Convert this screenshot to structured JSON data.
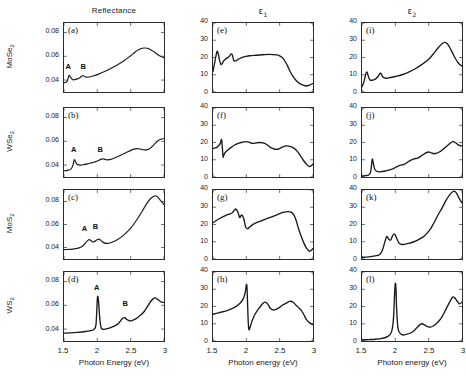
{
  "figure": {
    "columns": [
      {
        "id": "reflectance",
        "label": "Reflectance",
        "type": "plain"
      },
      {
        "id": "eps1",
        "label": "ε",
        "sub": "1",
        "type": "greek"
      },
      {
        "id": "eps2",
        "label": "ε",
        "sub": "2",
        "type": "greek"
      }
    ],
    "rows": [
      {
        "id": "mose2",
        "label": "MoSe",
        "sub": "2"
      },
      {
        "id": "wse2",
        "label": "WSe",
        "sub": "2"
      },
      {
        "id": "mos2",
        "label": "MoS",
        "sub": "2"
      },
      {
        "id": "ws2",
        "label": "WS",
        "sub": "2"
      }
    ],
    "xaxis_labels": {
      "reflectance": "Photon Energy (eV)",
      "eps1": "Photon energy (eV)",
      "eps2": "Photon energy (eV)"
    },
    "xticks": [
      "1.5",
      "2",
      "2.5",
      "3"
    ],
    "yticks_reflectance": [
      "0.04",
      "0.06",
      "0.08"
    ],
    "yticks_eps": [
      "0",
      "10",
      "20",
      "30",
      "40"
    ],
    "peak_labels": {
      "a": "A",
      "b": "B"
    }
  },
  "chart_data": [
    {
      "type": "line",
      "panel": "(a)",
      "row": "MoSe2",
      "column": "Reflectance",
      "title": "Reflectance",
      "xlabel": "Photon Energy (eV)",
      "ylabel": "MoSe2",
      "xlim": [
        1.5,
        3.0
      ],
      "ylim": [
        0.03,
        0.088
      ],
      "grid": false,
      "legend": "none",
      "annotations": [
        {
          "text": "A",
          "x": 1.58,
          "y": 0.0475
        },
        {
          "text": "B",
          "x": 1.8,
          "y": 0.0475
        }
      ],
      "x": [
        1.5,
        1.53,
        1.55,
        1.57,
        1.58,
        1.6,
        1.62,
        1.64,
        1.66,
        1.7,
        1.74,
        1.76,
        1.78,
        1.8,
        1.82,
        1.85,
        1.9,
        1.95,
        2.0,
        2.1,
        2.2,
        2.3,
        2.4,
        2.5,
        2.55,
        2.6,
        2.65,
        2.7,
        2.75,
        2.8,
        2.85,
        2.9,
        2.95,
        3.0
      ],
      "y": [
        0.0378,
        0.0382,
        0.0392,
        0.0432,
        0.044,
        0.0424,
        0.0408,
        0.0402,
        0.0404,
        0.041,
        0.042,
        0.0432,
        0.0437,
        0.0434,
        0.0428,
        0.0424,
        0.0428,
        0.0436,
        0.0446,
        0.047,
        0.0498,
        0.0528,
        0.0562,
        0.0605,
        0.0628,
        0.065,
        0.0664,
        0.067,
        0.0668,
        0.0656,
        0.0638,
        0.0618,
        0.06,
        0.0588
      ]
    },
    {
      "type": "line",
      "panel": "(b)",
      "row": "WSe2",
      "column": "Reflectance",
      "xlabel": "Photon Energy (eV)",
      "ylabel": "WSe2",
      "xlim": [
        1.5,
        3.0
      ],
      "ylim": [
        0.03,
        0.088
      ],
      "grid": false,
      "legend": "none",
      "annotations": [
        {
          "text": "A",
          "x": 1.66,
          "y": 0.049
        },
        {
          "text": "B",
          "x": 2.05,
          "y": 0.049
        }
      ],
      "x": [
        1.5,
        1.55,
        1.6,
        1.63,
        1.65,
        1.66,
        1.68,
        1.7,
        1.75,
        1.8,
        1.85,
        1.9,
        1.95,
        2.0,
        2.05,
        2.08,
        2.1,
        2.13,
        2.16,
        2.2,
        2.25,
        2.3,
        2.4,
        2.5,
        2.55,
        2.6,
        2.65,
        2.7,
        2.75,
        2.8,
        2.85,
        2.9,
        2.95,
        3.0
      ],
      "y": [
        0.0352,
        0.0356,
        0.0364,
        0.0392,
        0.0438,
        0.0444,
        0.042,
        0.0406,
        0.04,
        0.0404,
        0.041,
        0.0418,
        0.0424,
        0.0434,
        0.0448,
        0.0452,
        0.045,
        0.0446,
        0.0444,
        0.0448,
        0.0458,
        0.047,
        0.0496,
        0.0524,
        0.0534,
        0.0538,
        0.0534,
        0.0528,
        0.053,
        0.0545,
        0.0572,
        0.06,
        0.0618,
        0.0622
      ]
    },
    {
      "type": "line",
      "panel": "(c)",
      "row": "MoS2",
      "column": "Reflectance",
      "xlabel": "Photon Energy (eV)",
      "ylabel": "MoS2",
      "xlim": [
        1.5,
        3.0
      ],
      "ylim": [
        0.03,
        0.09
      ],
      "grid": false,
      "legend": "none",
      "annotations": [
        {
          "text": "A",
          "x": 1.82,
          "y": 0.052
        },
        {
          "text": "B",
          "x": 1.98,
          "y": 0.054
        }
      ],
      "x": [
        1.5,
        1.6,
        1.7,
        1.75,
        1.8,
        1.85,
        1.88,
        1.9,
        1.93,
        1.96,
        2.0,
        2.03,
        2.06,
        2.1,
        2.15,
        2.2,
        2.3,
        2.4,
        2.5,
        2.6,
        2.7,
        2.75,
        2.8,
        2.85,
        2.88,
        2.9,
        2.95,
        3.0
      ],
      "y": [
        0.0382,
        0.0384,
        0.0392,
        0.0402,
        0.0424,
        0.0458,
        0.0468,
        0.0462,
        0.0448,
        0.0452,
        0.047,
        0.0472,
        0.0458,
        0.044,
        0.0436,
        0.0442,
        0.0468,
        0.051,
        0.0568,
        0.0648,
        0.0742,
        0.079,
        0.0826,
        0.0846,
        0.0848,
        0.0842,
        0.0808,
        0.0772
      ]
    },
    {
      "type": "line",
      "panel": "(d)",
      "row": "WS2",
      "column": "Reflectance",
      "xlabel": "Photon Energy (eV)",
      "ylabel": "WS2",
      "xlim": [
        1.5,
        3.0
      ],
      "ylim": [
        0.03,
        0.088
      ],
      "grid": false,
      "legend": "none",
      "annotations": [
        {
          "text": "A",
          "x": 2.0,
          "y": 0.07
        },
        {
          "text": "B",
          "x": 2.42,
          "y": 0.057
        }
      ],
      "x": [
        1.5,
        1.6,
        1.7,
        1.8,
        1.9,
        1.95,
        1.98,
        2.0,
        2.01,
        2.02,
        2.04,
        2.06,
        2.1,
        2.15,
        2.2,
        2.3,
        2.35,
        2.38,
        2.41,
        2.44,
        2.48,
        2.52,
        2.56,
        2.6,
        2.65,
        2.7,
        2.75,
        2.8,
        2.84,
        2.87,
        2.9,
        2.95,
        3.0
      ],
      "y": [
        0.0366,
        0.0368,
        0.0372,
        0.0378,
        0.0388,
        0.0398,
        0.044,
        0.0652,
        0.0668,
        0.062,
        0.047,
        0.0408,
        0.0398,
        0.0404,
        0.0412,
        0.044,
        0.047,
        0.0492,
        0.0496,
        0.0482,
        0.047,
        0.0472,
        0.0482,
        0.0496,
        0.0518,
        0.0546,
        0.0588,
        0.0632,
        0.0656,
        0.0662,
        0.0652,
        0.063,
        0.0624
      ]
    },
    {
      "type": "line",
      "panel": "(e)",
      "row": "MoSe2",
      "column": "eps1",
      "title": "ε1",
      "xlabel": "Photon energy (eV)",
      "ylabel": "ε1",
      "xlim": [
        1.5,
        3.0
      ],
      "ylim": [
        0,
        40
      ],
      "grid": false,
      "legend": "none",
      "x": [
        1.5,
        1.53,
        1.56,
        1.58,
        1.6,
        1.62,
        1.64,
        1.66,
        1.7,
        1.74,
        1.77,
        1.79,
        1.81,
        1.84,
        1.88,
        1.95,
        2.05,
        2.15,
        2.25,
        2.35,
        2.45,
        2.5,
        2.55,
        2.6,
        2.65,
        2.7,
        2.75,
        2.8,
        2.85,
        2.9,
        2.95,
        3.0
      ],
      "y": [
        12.0,
        18.0,
        23.5,
        22.0,
        18.0,
        16.0,
        16.5,
        18.0,
        19.5,
        20.5,
        22.0,
        21.5,
        18.5,
        18.0,
        19.0,
        20.2,
        21.0,
        21.3,
        21.6,
        21.8,
        21.5,
        21.0,
        19.5,
        16.5,
        12.5,
        9.0,
        6.5,
        5.0,
        4.0,
        3.5,
        4.0,
        5.0
      ]
    },
    {
      "type": "line",
      "panel": "(f)",
      "row": "WSe2",
      "column": "eps1",
      "xlabel": "Photon energy (eV)",
      "ylabel": "ε1",
      "xlim": [
        1.5,
        3.0
      ],
      "ylim": [
        0,
        40
      ],
      "grid": false,
      "legend": "none",
      "x": [
        1.5,
        1.55,
        1.58,
        1.61,
        1.63,
        1.65,
        1.66,
        1.68,
        1.7,
        1.75,
        1.8,
        1.85,
        1.92,
        2.0,
        2.05,
        2.1,
        2.15,
        2.2,
        2.25,
        2.3,
        2.35,
        2.4,
        2.45,
        2.5,
        2.55,
        2.6,
        2.65,
        2.7,
        2.75,
        2.8,
        2.85,
        2.9,
        2.95,
        3.0
      ],
      "y": [
        16.5,
        17.0,
        18.0,
        19.5,
        21.5,
        12.0,
        12.5,
        14.0,
        15.0,
        16.5,
        18.0,
        19.0,
        20.0,
        20.5,
        20.0,
        19.5,
        19.8,
        20.0,
        19.8,
        19.0,
        17.5,
        16.5,
        16.0,
        16.5,
        17.5,
        18.0,
        17.8,
        17.0,
        15.5,
        13.0,
        10.0,
        7.5,
        6.0,
        7.5
      ]
    },
    {
      "type": "line",
      "panel": "(g)",
      "row": "MoS2",
      "column": "eps1",
      "xlabel": "Photon energy (eV)",
      "ylabel": "ε1",
      "xlim": [
        1.5,
        3.0
      ],
      "ylim": [
        0,
        40
      ],
      "grid": false,
      "legend": "none",
      "x": [
        1.5,
        1.6,
        1.7,
        1.78,
        1.84,
        1.88,
        1.9,
        1.93,
        1.96,
        1.99,
        2.02,
        2.05,
        2.08,
        2.12,
        2.18,
        2.25,
        2.35,
        2.45,
        2.55,
        2.62,
        2.68,
        2.72,
        2.75,
        2.78,
        2.82,
        2.86,
        2.9,
        2.95,
        3.0
      ],
      "y": [
        21.0,
        23.5,
        25.5,
        26.5,
        29.0,
        26.5,
        24.0,
        25.5,
        23.5,
        18.5,
        17.5,
        18.5,
        19.5,
        20.5,
        21.5,
        22.5,
        24.0,
        25.5,
        27.0,
        27.5,
        27.0,
        25.0,
        22.0,
        18.0,
        13.5,
        9.5,
        6.5,
        4.5,
        6.0
      ]
    },
    {
      "type": "line",
      "panel": "(h)",
      "row": "WS2",
      "column": "eps1",
      "xlabel": "Photon energy (eV)",
      "ylabel": "ε1",
      "xlim": [
        1.5,
        3.0
      ],
      "ylim": [
        0,
        40
      ],
      "grid": false,
      "legend": "none",
      "x": [
        1.5,
        1.6,
        1.7,
        1.8,
        1.88,
        1.94,
        1.98,
        2.0,
        2.01,
        2.02,
        2.03,
        2.04,
        2.06,
        2.09,
        2.13,
        2.18,
        2.24,
        2.28,
        2.32,
        2.36,
        2.4,
        2.45,
        2.5,
        2.55,
        2.6,
        2.65,
        2.7,
        2.74,
        2.78,
        2.82,
        2.86,
        2.9,
        2.95,
        3.0
      ],
      "y": [
        15.5,
        16.5,
        17.5,
        19.0,
        21.0,
        23.5,
        27.5,
        32.5,
        31.0,
        20.0,
        10.0,
        6.5,
        8.5,
        12.0,
        15.5,
        18.5,
        21.5,
        22.5,
        21.5,
        19.0,
        18.0,
        18.5,
        19.5,
        21.0,
        22.0,
        23.0,
        22.5,
        21.0,
        19.5,
        18.0,
        15.5,
        12.5,
        10.5,
        9.5
      ]
    },
    {
      "type": "line",
      "panel": "(i)",
      "row": "MoSe2",
      "column": "eps2",
      "title": "ε2",
      "xlabel": "Photon energy (eV)",
      "ylabel": "ε2",
      "xlim": [
        1.5,
        3.0
      ],
      "ylim": [
        0,
        40
      ],
      "grid": false,
      "legend": "none",
      "x": [
        1.5,
        1.53,
        1.55,
        1.57,
        1.58,
        1.6,
        1.62,
        1.65,
        1.7,
        1.74,
        1.77,
        1.79,
        1.81,
        1.85,
        1.9,
        2.0,
        2.1,
        2.2,
        2.3,
        2.4,
        2.5,
        2.58,
        2.64,
        2.7,
        2.74,
        2.78,
        2.82,
        2.86,
        2.9,
        2.95,
        3.0
      ],
      "y": [
        3.0,
        6.0,
        9.5,
        11.5,
        11.0,
        8.5,
        7.0,
        6.8,
        7.5,
        9.0,
        10.8,
        10.5,
        8.8,
        8.0,
        8.2,
        9.0,
        10.0,
        11.5,
        13.5,
        16.0,
        19.0,
        22.5,
        25.5,
        28.0,
        28.8,
        28.0,
        25.5,
        22.5,
        19.5,
        16.5,
        15.0
      ]
    },
    {
      "type": "line",
      "panel": "(j)",
      "row": "WSe2",
      "column": "eps2",
      "xlabel": "Photon energy (eV)",
      "ylabel": "ε2",
      "xlim": [
        1.5,
        3.0
      ],
      "ylim": [
        0,
        40
      ],
      "grid": false,
      "legend": "none",
      "x": [
        1.5,
        1.55,
        1.6,
        1.63,
        1.65,
        1.66,
        1.68,
        1.7,
        1.75,
        1.8,
        1.85,
        1.9,
        1.95,
        2.0,
        2.05,
        2.1,
        2.14,
        2.18,
        2.22,
        2.28,
        2.34,
        2.4,
        2.46,
        2.5,
        2.54,
        2.58,
        2.62,
        2.66,
        2.7,
        2.76,
        2.82,
        2.86,
        2.9,
        2.95,
        3.0
      ],
      "y": [
        0.5,
        0.8,
        1.2,
        3.0,
        9.5,
        10.0,
        6.0,
        4.0,
        3.0,
        3.2,
        3.5,
        4.0,
        4.5,
        5.5,
        6.5,
        7.0,
        7.5,
        8.5,
        9.5,
        10.5,
        11.0,
        12.5,
        14.0,
        14.5,
        14.0,
        13.5,
        13.8,
        14.5,
        15.5,
        17.5,
        19.5,
        20.5,
        20.0,
        18.5,
        18.0
      ]
    },
    {
      "type": "line",
      "panel": "(k)",
      "row": "MoS2",
      "column": "eps2",
      "xlabel": "Photon energy (eV)",
      "ylabel": "ε2",
      "xlim": [
        1.5,
        3.0
      ],
      "ylim": [
        0,
        40
      ],
      "grid": false,
      "legend": "none",
      "x": [
        1.5,
        1.6,
        1.7,
        1.76,
        1.8,
        1.84,
        1.87,
        1.9,
        1.93,
        1.96,
        1.99,
        2.02,
        2.05,
        2.09,
        2.14,
        2.2,
        2.28,
        2.36,
        2.44,
        2.52,
        2.58,
        2.64,
        2.7,
        2.76,
        2.82,
        2.86,
        2.89,
        2.92,
        2.96,
        3.0
      ],
      "y": [
        1.0,
        1.2,
        1.8,
        2.5,
        4.5,
        9.5,
        13.0,
        11.5,
        11.0,
        13.5,
        14.5,
        12.0,
        9.5,
        8.5,
        8.5,
        9.0,
        10.0,
        11.5,
        13.5,
        17.0,
        21.0,
        25.5,
        29.5,
        34.0,
        37.5,
        39.0,
        39.2,
        38.0,
        35.0,
        32.5
      ]
    },
    {
      "type": "line",
      "panel": "(l)",
      "row": "WS2",
      "column": "eps2",
      "xlabel": "Photon energy (eV)",
      "ylabel": "ε2",
      "xlim": [
        1.5,
        3.0
      ],
      "ylim": [
        0,
        40
      ],
      "grid": false,
      "legend": "none",
      "x": [
        1.5,
        1.6,
        1.7,
        1.8,
        1.88,
        1.94,
        1.97,
        1.99,
        2.0,
        2.01,
        2.02,
        2.04,
        2.07,
        2.11,
        2.16,
        2.22,
        2.28,
        2.33,
        2.37,
        2.4,
        2.43,
        2.47,
        2.52,
        2.58,
        2.64,
        2.7,
        2.76,
        2.82,
        2.86,
        2.89,
        2.92,
        2.96,
        3.0
      ],
      "y": [
        0.6,
        0.8,
        1.0,
        1.5,
        2.5,
        5.0,
        12.0,
        28.0,
        33.5,
        30.0,
        18.0,
        7.5,
        4.5,
        3.5,
        3.8,
        4.5,
        6.0,
        8.0,
        9.5,
        10.0,
        9.5,
        8.5,
        8.0,
        9.0,
        11.0,
        14.0,
        18.5,
        23.0,
        25.5,
        25.0,
        23.5,
        21.5,
        22.5
      ]
    }
  ]
}
